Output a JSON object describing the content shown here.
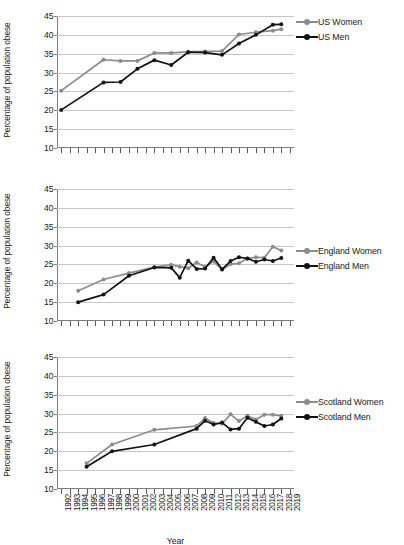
{
  "figure": {
    "xlabel": "Year",
    "ylabel": "Percentage of population obese"
  },
  "chart_data": [
    {
      "type": "line",
      "title": "",
      "xlabel": "Year",
      "ylabel": "Percentage of population obese",
      "ylim": [
        10,
        45
      ],
      "yticks": [
        10,
        15,
        20,
        25,
        30,
        35,
        40,
        45
      ],
      "grid": true,
      "legend_position": "right",
      "x": [
        1992,
        1993,
        1994,
        1995,
        1996,
        1997,
        1998,
        1999,
        2000,
        2001,
        2002,
        2003,
        2004,
        2005,
        2006,
        2007,
        2008,
        2009,
        2010,
        2011,
        2012,
        2013,
        2014,
        2015,
        2016,
        2017,
        2018,
        2019
      ],
      "series": [
        {
          "name": "US Women",
          "color": "#8c8c8c",
          "x": [
            1992,
            1997,
            1999,
            2001,
            2003,
            2005,
            2007,
            2009,
            2011,
            2013,
            2015,
            2017,
            2018
          ],
          "values": [
            25.2,
            33.4,
            33.1,
            33.1,
            35.2,
            35.2,
            35.5,
            35.6,
            35.7,
            40.1,
            40.7,
            41.1,
            41.5
          ]
        },
        {
          "name": "US Men",
          "color": "#121212",
          "x": [
            1992,
            1997,
            1999,
            2001,
            2003,
            2005,
            2007,
            2009,
            2011,
            2013,
            2015,
            2017,
            2018
          ],
          "values": [
            20.1,
            27.4,
            27.5,
            31.0,
            33.3,
            32.0,
            35.4,
            35.3,
            34.7,
            37.7,
            40.0,
            42.7,
            42.8
          ]
        }
      ]
    },
    {
      "type": "line",
      "title": "",
      "xlabel": "Year",
      "ylabel": "Percentage of population obese",
      "ylim": [
        10,
        45
      ],
      "yticks": [
        10,
        15,
        20,
        25,
        30,
        35,
        40,
        45
      ],
      "grid": true,
      "legend_position": "right",
      "x": [
        1992,
        1993,
        1994,
        1995,
        1996,
        1997,
        1998,
        1999,
        2000,
        2001,
        2002,
        2003,
        2004,
        2005,
        2006,
        2007,
        2008,
        2009,
        2010,
        2011,
        2012,
        2013,
        2014,
        2015,
        2016,
        2017,
        2018,
        2019
      ],
      "series": [
        {
          "name": "England Women",
          "color": "#8c8c8c",
          "x": [
            1994,
            1997,
            2000,
            2003,
            2005,
            2006,
            2007,
            2008,
            2009,
            2010,
            2011,
            2012,
            2013,
            2014,
            2015,
            2016,
            2017,
            2018
          ],
          "values": [
            18.0,
            21.0,
            22.7,
            24.3,
            24.9,
            24.4,
            24.0,
            25.5,
            24.3,
            25.8,
            23.6,
            25.1,
            25.3,
            26.6,
            26.9,
            26.8,
            29.7,
            28.7
          ]
        },
        {
          "name": "England Men",
          "color": "#121212",
          "x": [
            1994,
            1997,
            2000,
            2003,
            2005,
            2006,
            2007,
            2008,
            2009,
            2010,
            2011,
            2012,
            2013,
            2014,
            2015,
            2016,
            2017,
            2018
          ],
          "values": [
            15.0,
            17.0,
            22.0,
            24.2,
            24.1,
            21.5,
            26.0,
            23.8,
            23.9,
            26.8,
            23.7,
            25.9,
            26.9,
            26.6,
            25.7,
            26.3,
            25.9,
            26.7
          ]
        }
      ]
    },
    {
      "type": "line",
      "title": "",
      "xlabel": "Year",
      "ylabel": "Percentage of population obese",
      "ylim": [
        10,
        45
      ],
      "yticks": [
        10,
        15,
        20,
        25,
        30,
        35,
        40,
        45
      ],
      "grid": true,
      "legend_position": "right",
      "x": [
        1992,
        1993,
        1994,
        1995,
        1996,
        1997,
        1998,
        1999,
        2000,
        2001,
        2002,
        2003,
        2004,
        2005,
        2006,
        2007,
        2008,
        2009,
        2010,
        2011,
        2012,
        2013,
        2014,
        2015,
        2016,
        2017,
        2018,
        2019
      ],
      "series": [
        {
          "name": "Scotland Women",
          "color": "#8c8c8c",
          "x": [
            1995,
            1998,
            2003,
            2008,
            2009,
            2010,
            2011,
            2012,
            2013,
            2014,
            2015,
            2016,
            2017,
            2018
          ],
          "values": [
            16.8,
            21.8,
            25.7,
            26.7,
            28.8,
            27.5,
            27.3,
            29.8,
            28.0,
            29.4,
            28.4,
            29.7,
            29.7,
            29.4
          ]
        },
        {
          "name": "Scotland Men",
          "color": "#121212",
          "x": [
            1995,
            1998,
            2003,
            2008,
            2009,
            2010,
            2011,
            2012,
            2013,
            2014,
            2015,
            2016,
            2017,
            2018
          ],
          "values": [
            15.9,
            20.0,
            21.8,
            26.0,
            28.1,
            27.1,
            27.6,
            25.8,
            26.0,
            28.9,
            27.8,
            26.7,
            27.1,
            28.7
          ]
        }
      ]
    }
  ],
  "xaxis": {
    "labels": [
      "1992",
      "1993",
      "1994",
      "1995",
      "1996",
      "1997",
      "1998",
      "1999",
      "2000",
      "2001",
      "2002",
      "2003",
      "2004",
      "2005",
      "2006",
      "2007",
      "2008",
      "2009",
      "2010",
      "2011",
      "2012",
      "2013",
      "2014",
      "2015",
      "2016",
      "2017",
      "2018",
      "2019"
    ]
  },
  "panels": [
    {
      "id": "us",
      "legend": [
        {
          "label": "US Women",
          "color": "#8c8c8c"
        },
        {
          "label": "US Men",
          "color": "#121212"
        }
      ]
    },
    {
      "id": "england",
      "legend": [
        {
          "label": "England Women",
          "color": "#8c8c8c"
        },
        {
          "label": "England Men",
          "color": "#121212"
        }
      ]
    },
    {
      "id": "scotland",
      "legend": [
        {
          "label": "Scotland Women",
          "color": "#8c8c8c"
        },
        {
          "label": "Scotland Men",
          "color": "#121212"
        }
      ]
    }
  ]
}
